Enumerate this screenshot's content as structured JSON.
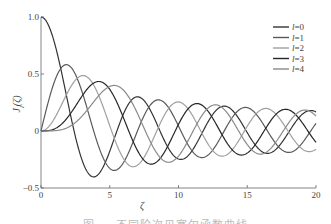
{
  "chart_data": {
    "type": "line",
    "title": "",
    "xlabel": "ζ",
    "ylabel": "J_l(ζ)",
    "xlim": [
      0,
      20
    ],
    "ylim": [
      -0.5,
      1.0
    ],
    "xticks": [
      0,
      5,
      10,
      15,
      20
    ],
    "yticks": [
      -0.5,
      0,
      0.5,
      1.0
    ],
    "xtick_labels": [
      "0",
      "5",
      "10",
      "15",
      "20"
    ],
    "ytick_labels": [
      "−0.5",
      "0",
      "0.5",
      "1.0"
    ],
    "grid": false,
    "legend_position": "upper right",
    "x": [
      0,
      1,
      2,
      3,
      4,
      5,
      6,
      7,
      8,
      9,
      10,
      11,
      12,
      13,
      14,
      15,
      16,
      17,
      18,
      19,
      20
    ],
    "series": [
      {
        "name": "l=0",
        "order": 0,
        "color": "#333333",
        "values": [
          1.0,
          0.765,
          0.224,
          -0.26,
          -0.397,
          -0.178,
          0.151,
          0.3,
          0.172,
          -0.09,
          -0.246,
          -0.171,
          0.048,
          0.207,
          0.171,
          -0.014,
          -0.175,
          -0.17,
          -0.013,
          0.147,
          0.167
        ]
      },
      {
        "name": "l=1",
        "order": 1,
        "color": "#5a5a5a",
        "values": [
          0.0,
          0.44,
          0.577,
          0.339,
          -0.066,
          -0.328,
          -0.277,
          -0.005,
          0.235,
          0.245,
          0.043,
          -0.177,
          -0.223,
          -0.07,
          0.133,
          0.205,
          0.09,
          -0.098,
          -0.188,
          -0.106,
          0.067
        ]
      },
      {
        "name": "l=2",
        "order": 2,
        "color": "#a0a0a0",
        "values": [
          0.0,
          0.115,
          0.353,
          0.486,
          0.364,
          0.047,
          -0.243,
          -0.301,
          -0.113,
          0.145,
          0.255,
          0.139,
          -0.085,
          -0.218,
          -0.152,
          0.042,
          0.186,
          0.158,
          -0.008,
          -0.158,
          -0.16
        ]
      },
      {
        "name": "l=3",
        "order": 3,
        "color": "#262626",
        "values": [
          0.0,
          0.02,
          0.129,
          0.309,
          0.43,
          0.365,
          0.115,
          -0.168,
          -0.291,
          -0.181,
          0.058,
          0.227,
          0.195,
          -0.003,
          -0.177,
          -0.194,
          -0.044,
          0.135,
          0.186,
          0.072,
          -0.099
        ]
      },
      {
        "name": "l=4",
        "order": 4,
        "color": "#8a8a8a",
        "values": [
          0.0,
          0.002,
          0.034,
          0.132,
          0.281,
          0.391,
          0.358,
          0.158,
          -0.105,
          -0.265,
          -0.22,
          -0.015,
          0.182,
          0.219,
          0.076,
          -0.119,
          -0.202,
          -0.111,
          0.069,
          0.181,
          0.181
        ]
      }
    ],
    "legend": [
      {
        "prefix": "l",
        "label": "=0"
      },
      {
        "prefix": "l",
        "label": "=1"
      },
      {
        "prefix": "l",
        "label": "=2"
      },
      {
        "prefix": "l",
        "label": "=3"
      },
      {
        "prefix": "l",
        "label": "=4"
      }
    ]
  },
  "caption": "图 — 不同阶次贝塞尔函数曲线"
}
